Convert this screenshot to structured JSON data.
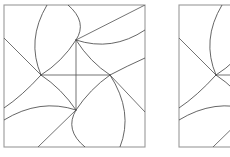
{
  "figure": {
    "title": "",
    "panel_count": 2,
    "background_color": "#ffffff",
    "frame_color": "#9a9a9a",
    "curve_color": "#4a4a4a",
    "straight_color": "#5a5a5a",
    "panels": [
      {
        "name": "left-panel",
        "label": "",
        "frame": {
          "x": 4,
          "y": 5,
          "width": 141,
          "height": 142
        },
        "clipped": false,
        "nodes": [
          {
            "name": "node-top",
            "x": 76,
            "y": 40
          },
          {
            "name": "node-left",
            "x": 41,
            "y": 75
          },
          {
            "name": "node-right",
            "x": 110,
            "y": 75
          },
          {
            "name": "node-bottom",
            "x": 76,
            "y": 110
          }
        ],
        "straight_segments": [
          {
            "name": "cross-vertical",
            "from": [
              76,
              40
            ],
            "to": [
              76,
              110
            ]
          },
          {
            "name": "cross-horizontal",
            "from": [
              41,
              75
            ],
            "to": [
              110,
              75
            ]
          },
          {
            "name": "ray-top-upright",
            "from": [
              76,
              40
            ],
            "to": [
              145,
              5
            ]
          },
          {
            "name": "ray-left-upleft",
            "from": [
              41,
              75
            ],
            "to": [
              4,
              38
            ]
          },
          {
            "name": "ray-right-downright",
            "from": [
              110,
              75
            ],
            "to": [
              145,
              112
            ]
          },
          {
            "name": "ray-bottom-downleft",
            "from": [
              76,
              110
            ],
            "to": [
              38,
              147
            ]
          }
        ],
        "curve_arcs": [
          {
            "name": "arc-center-tl",
            "from": [
              76,
              40
            ],
            "to": [
              41,
              75
            ],
            "ctrl": [
              62,
              62
            ]
          },
          {
            "name": "arc-center-tr",
            "from": [
              76,
              40
            ],
            "to": [
              110,
              75
            ],
            "ctrl": [
              90,
              62
            ]
          },
          {
            "name": "arc-center-bl",
            "from": [
              41,
              75
            ],
            "to": [
              76,
              110
            ],
            "ctrl": [
              62,
              89
            ]
          },
          {
            "name": "arc-center-br",
            "from": [
              110,
              75
            ],
            "to": [
              76,
              110
            ],
            "ctrl": [
              90,
              89
            ]
          },
          {
            "name": "arc-top-to-topedge",
            "from": [
              76,
              40
            ],
            "to": [
              68,
              5
            ],
            "ctrl": [
              88,
              22
            ]
          },
          {
            "name": "arc-top-to-rightedge",
            "from": [
              76,
              40
            ],
            "to": [
              145,
              30
            ],
            "ctrl": [
              112,
              52
            ]
          },
          {
            "name": "arc-left-to-topedge",
            "from": [
              41,
              75
            ],
            "to": [
              47,
              5
            ],
            "ctrl": [
              26,
              40
            ]
          },
          {
            "name": "arc-left-to-leftedge",
            "from": [
              41,
              75
            ],
            "to": [
              4,
              108
            ],
            "ctrl": [
              22,
              96
            ]
          },
          {
            "name": "arc-right-to-rightedge",
            "from": [
              110,
              75
            ],
            "to": [
              145,
              58
            ],
            "ctrl": [
              127,
              66
            ]
          },
          {
            "name": "arc-right-to-bottom",
            "from": [
              110,
              75
            ],
            "to": [
              120,
              147
            ],
            "ctrl": [
              134,
              112
            ]
          },
          {
            "name": "arc-bottom-to-bottomedge",
            "from": [
              76,
              110
            ],
            "to": [
              85,
              147
            ],
            "ctrl": [
              64,
              130
            ]
          },
          {
            "name": "arc-bottom-to-leftedge",
            "from": [
              76,
              110
            ],
            "to": [
              4,
              120
            ],
            "ctrl": [
              40,
              98
            ]
          }
        ]
      },
      {
        "name": "right-panel",
        "label": "",
        "frame": {
          "x": 179,
          "y": 5,
          "width": 141,
          "height": 142
        },
        "clipped": true,
        "clip_right_at": 230,
        "nodes": [
          {
            "name": "node-top",
            "x": 251,
            "y": 40
          },
          {
            "name": "node-left",
            "x": 216,
            "y": 75
          },
          {
            "name": "node-right",
            "x": 285,
            "y": 75
          },
          {
            "name": "node-bottom",
            "x": 251,
            "y": 110
          }
        ],
        "straight_segments": [
          {
            "name": "cross-vertical",
            "from": [
              251,
              40
            ],
            "to": [
              251,
              110
            ]
          },
          {
            "name": "cross-horizontal",
            "from": [
              216,
              75
            ],
            "to": [
              285,
              75
            ]
          },
          {
            "name": "ray-top-upright",
            "from": [
              251,
              40
            ],
            "to": [
              320,
              5
            ]
          },
          {
            "name": "ray-left-upleft",
            "from": [
              216,
              75
            ],
            "to": [
              179,
              38
            ]
          },
          {
            "name": "ray-right-downright",
            "from": [
              285,
              75
            ],
            "to": [
              320,
              112
            ]
          },
          {
            "name": "ray-bottom-downleft",
            "from": [
              251,
              110
            ],
            "to": [
              213,
              147
            ]
          }
        ],
        "curve_arcs": [
          {
            "name": "arc-center-tl",
            "from": [
              251,
              40
            ],
            "to": [
              216,
              75
            ],
            "ctrl": [
              237,
              62
            ]
          },
          {
            "name": "arc-center-tr",
            "from": [
              251,
              40
            ],
            "to": [
              285,
              75
            ],
            "ctrl": [
              265,
              62
            ]
          },
          {
            "name": "arc-center-bl",
            "from": [
              216,
              75
            ],
            "to": [
              251,
              110
            ],
            "ctrl": [
              237,
              89
            ]
          },
          {
            "name": "arc-center-br",
            "from": [
              285,
              75
            ],
            "to": [
              251,
              110
            ],
            "ctrl": [
              265,
              89
            ]
          },
          {
            "name": "arc-top-to-topedge",
            "from": [
              251,
              40
            ],
            "to": [
              243,
              5
            ],
            "ctrl": [
              263,
              22
            ]
          },
          {
            "name": "arc-top-to-rightedge",
            "from": [
              251,
              40
            ],
            "to": [
              320,
              30
            ],
            "ctrl": [
              287,
              52
            ]
          },
          {
            "name": "arc-left-to-topedge",
            "from": [
              216,
              75
            ],
            "to": [
              222,
              5
            ],
            "ctrl": [
              201,
              40
            ]
          },
          {
            "name": "arc-left-to-leftedge",
            "from": [
              216,
              75
            ],
            "to": [
              179,
              108
            ],
            "ctrl": [
              197,
              96
            ]
          },
          {
            "name": "arc-right-to-rightedge",
            "from": [
              285,
              75
            ],
            "to": [
              320,
              58
            ],
            "ctrl": [
              302,
              66
            ]
          },
          {
            "name": "arc-right-to-bottom",
            "from": [
              285,
              75
            ],
            "to": [
              295,
              147
            ],
            "ctrl": [
              309,
              112
            ]
          },
          {
            "name": "arc-bottom-to-bottomedge",
            "from": [
              251,
              110
            ],
            "to": [
              260,
              147
            ],
            "ctrl": [
              239,
              130
            ]
          },
          {
            "name": "arc-bottom-to-leftedge",
            "from": [
              251,
              110
            ],
            "to": [
              179,
              120
            ],
            "ctrl": [
              215,
              98
            ]
          }
        ]
      }
    ]
  }
}
